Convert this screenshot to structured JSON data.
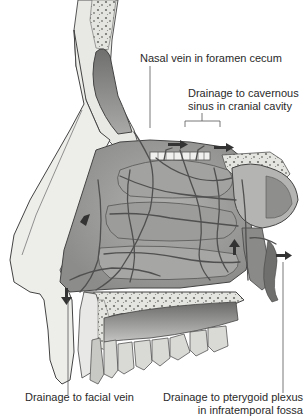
{
  "figure": {
    "colors": {
      "background": "#ffffff",
      "bone": "#e6e6e2",
      "bone_spongy": "#8a8a86",
      "mucosa": "#9a9a98",
      "mucosa_dark": "#6a6a68",
      "veins": "#5a5a58",
      "teeth": "#d8d8d4",
      "label_text": "#2a2a2a",
      "leader_line": "#555555"
    }
  },
  "labels": {
    "nasal_vein": "Nasal vein in foramen cecum",
    "cavernous_line1": "Drainage to cavernous",
    "cavernous_line2": "sinus in cranial cavity",
    "facial_vein": "Drainage to facial vein",
    "pterygoid_line1": "Drainage to pterygoid plexus",
    "pterygoid_line2": "in infratemporal fossa"
  },
  "arrows": [
    {
      "name": "arrow-cavernous-1",
      "direction": "right"
    },
    {
      "name": "arrow-cavernous-2",
      "direction": "right"
    },
    {
      "name": "arrow-facial",
      "direction": "down"
    },
    {
      "name": "arrow-pterygoid",
      "direction": "right"
    },
    {
      "name": "arrow-internal-up",
      "direction": "up"
    },
    {
      "name": "arrow-internal-down",
      "direction": "down-left"
    }
  ]
}
